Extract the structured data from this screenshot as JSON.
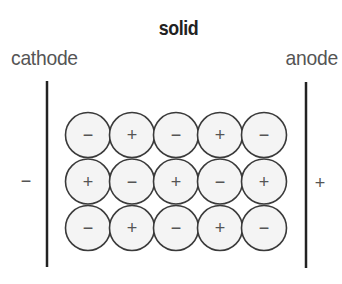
{
  "diagram": {
    "title": "solid",
    "left_electrode": {
      "label": "cathode",
      "polarity": "−"
    },
    "right_electrode": {
      "label": "anode",
      "polarity": "+"
    },
    "lattice": {
      "rows": [
        [
          "−",
          "+",
          "−",
          "+",
          "−"
        ],
        [
          "+",
          "−",
          "+",
          "−",
          "+"
        ],
        [
          "−",
          "+",
          "−",
          "+",
          "−"
        ]
      ]
    },
    "colors": {
      "ion_fill": "#f4f4f4",
      "ion_stroke": "#3a3a3a",
      "electrode": "#222222",
      "text": "#555555"
    }
  }
}
